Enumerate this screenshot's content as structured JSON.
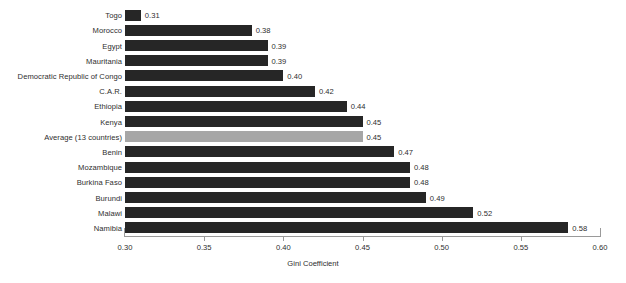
{
  "chart_data": {
    "type": "bar",
    "orientation": "horizontal",
    "title": "",
    "subtitle": "",
    "xlabel": "Gini Coefficient",
    "ylabel": "",
    "xlim": [
      0.3,
      0.6
    ],
    "xticks": [
      "0.30",
      "0.35",
      "0.40",
      "0.45",
      "0.50",
      "0.55",
      "0.60"
    ],
    "xtick_values": [
      0.3,
      0.35,
      0.4,
      0.45,
      0.5,
      0.55,
      0.6
    ],
    "grid": false,
    "legend": "none",
    "categories": [
      "Togo",
      "Morocco",
      "Egypt",
      "Mauritania",
      "Democratic Republic of Congo",
      "C.A.R.",
      "Ethiopia",
      "Kenya",
      "Average (13 countries)",
      "Benin",
      "Mozambique",
      "Burkina Faso",
      "Burundi",
      "Malawi",
      "Namibia"
    ],
    "values": [
      0.31,
      0.38,
      0.39,
      0.39,
      0.4,
      0.42,
      0.44,
      0.45,
      0.45,
      0.47,
      0.48,
      0.48,
      0.49,
      0.52,
      0.58
    ],
    "value_labels": [
      "0.31",
      "0.38",
      "0.39",
      "0.39",
      "0.40",
      "0.42",
      "0.44",
      "0.45",
      "0.45",
      "0.47",
      "0.48",
      "0.48",
      "0.49",
      "0.52",
      "0.58"
    ],
    "highlight_index": 8,
    "colors": {
      "bar": "#262626",
      "highlight_bar": "#a6a6a6",
      "axis": "#9a9a9a",
      "text": "#2e2e2e",
      "background": "#ffffff"
    }
  }
}
